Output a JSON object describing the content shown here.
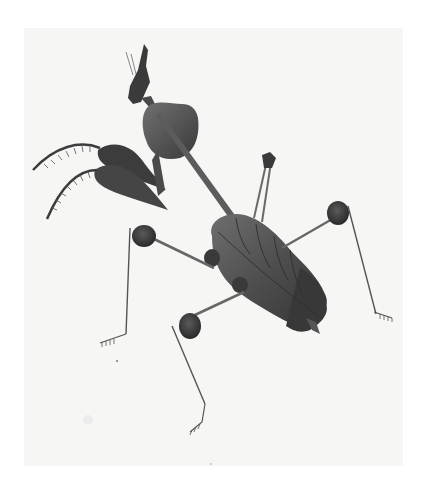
{
  "image": {
    "subject": "Leaf-like praying mantis (ghost mantis) illustration",
    "style": "monochrome natural-history engraving on paper",
    "parts": [
      "head with antennae and crest",
      "leaf-shaped pronotum",
      "raptorial forelegs with spines",
      "leaf-shaped abdomen with veins",
      "four walking legs with lobed joints and clawed tarsi"
    ]
  },
  "colors": {
    "page": "#ffffff",
    "paper": "#f6f6f5",
    "ink_dark": "#2e2e2e",
    "ink_mid": "#555555",
    "ink_light": "#7a7a7a"
  }
}
